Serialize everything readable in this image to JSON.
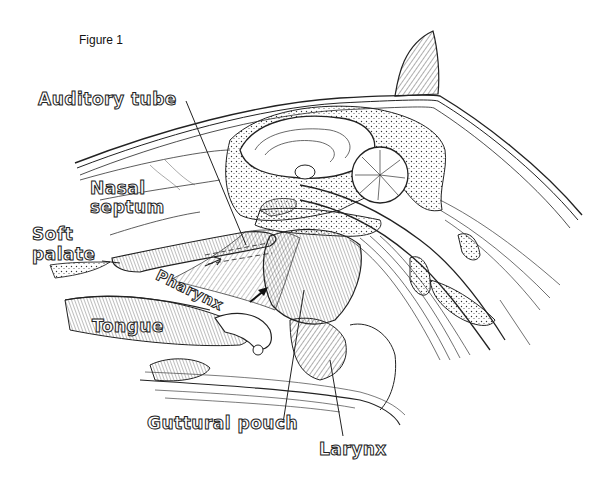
{
  "figure": {
    "title": "Figure 1"
  },
  "labels": {
    "auditory_tube": "Auditory tube",
    "nasal_septum_1": "Nasal",
    "nasal_septum_2": "septum",
    "soft_palate_1": "Soft",
    "soft_palate_2": "palate",
    "pharynx": "Pharynx",
    "tongue": "Tongue",
    "guttural_pouch": "Guttural pouch",
    "larynx": "Larynx"
  },
  "colors": {
    "ink": "#222222",
    "background": "#ffffff"
  }
}
